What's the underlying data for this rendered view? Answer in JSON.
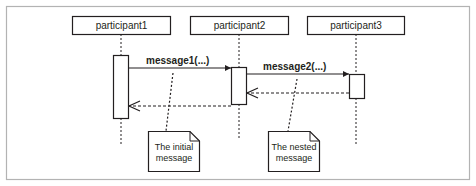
{
  "diagram": {
    "type": "uml-sequence",
    "participants": [
      {
        "id": "p1",
        "label": "participant1"
      },
      {
        "id": "p2",
        "label": "participant2"
      },
      {
        "id": "p3",
        "label": "participant3"
      }
    ],
    "messages": [
      {
        "from": "p1",
        "to": "p2",
        "label": "message1(...)",
        "kind": "synchronous"
      },
      {
        "from": "p2",
        "to": "p3",
        "label": "message2(...)",
        "kind": "synchronous"
      },
      {
        "from": "p3",
        "to": "p2",
        "label": "",
        "kind": "return"
      },
      {
        "from": "p2",
        "to": "p1",
        "label": "",
        "kind": "return"
      }
    ],
    "notes": [
      {
        "line1": "The initial",
        "line2": "message",
        "attached_to": "message1"
      },
      {
        "line1": "The nested",
        "line2": "message",
        "attached_to": "message2"
      }
    ],
    "colors": {
      "stroke": "#231f20",
      "frame": "#b3b3b3",
      "background": "#ffffff"
    }
  }
}
